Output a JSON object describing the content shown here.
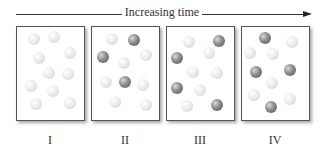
{
  "arrow": {
    "label": "Increasing time"
  },
  "panels": [
    {
      "label": "I",
      "left": 16,
      "spheres": [
        {
          "x": 17,
          "y": 12,
          "t": "light"
        },
        {
          "x": 37,
          "y": 10,
          "t": "light"
        },
        {
          "x": 53,
          "y": 26,
          "t": "light"
        },
        {
          "x": 22,
          "y": 31,
          "t": "light"
        },
        {
          "x": 32,
          "y": 46,
          "t": "light"
        },
        {
          "x": 51,
          "y": 47,
          "t": "light"
        },
        {
          "x": 14,
          "y": 59,
          "t": "light"
        },
        {
          "x": 36,
          "y": 64,
          "t": "light"
        },
        {
          "x": 19,
          "y": 77,
          "t": "light"
        },
        {
          "x": 53,
          "y": 76,
          "t": "light"
        }
      ]
    },
    {
      "label": "II",
      "left": 91,
      "spheres": [
        {
          "x": 20,
          "y": 12,
          "t": "light"
        },
        {
          "x": 42,
          "y": 13,
          "t": "dark"
        },
        {
          "x": 11,
          "y": 30,
          "t": "dark"
        },
        {
          "x": 54,
          "y": 28,
          "t": "light"
        },
        {
          "x": 32,
          "y": 36,
          "t": "light"
        },
        {
          "x": 14,
          "y": 55,
          "t": "light"
        },
        {
          "x": 33,
          "y": 55,
          "t": "dark"
        },
        {
          "x": 51,
          "y": 58,
          "t": "light"
        },
        {
          "x": 23,
          "y": 75,
          "t": "light"
        },
        {
          "x": 54,
          "y": 78,
          "t": "light"
        }
      ]
    },
    {
      "label": "III",
      "left": 166,
      "spheres": [
        {
          "x": 22,
          "y": 15,
          "t": "light"
        },
        {
          "x": 52,
          "y": 14,
          "t": "dark"
        },
        {
          "x": 10,
          "y": 31,
          "t": "dark"
        },
        {
          "x": 42,
          "y": 26,
          "t": "light"
        },
        {
          "x": 26,
          "y": 45,
          "t": "light"
        },
        {
          "x": 50,
          "y": 46,
          "t": "light"
        },
        {
          "x": 10,
          "y": 61,
          "t": "dark"
        },
        {
          "x": 33,
          "y": 63,
          "t": "light"
        },
        {
          "x": 20,
          "y": 79,
          "t": "light"
        },
        {
          "x": 50,
          "y": 78,
          "t": "dark"
        }
      ]
    },
    {
      "label": "IV",
      "left": 241,
      "spheres": [
        {
          "x": 23,
          "y": 11,
          "t": "dark"
        },
        {
          "x": 50,
          "y": 15,
          "t": "light"
        },
        {
          "x": 8,
          "y": 26,
          "t": "light"
        },
        {
          "x": 31,
          "y": 27,
          "t": "light"
        },
        {
          "x": 14,
          "y": 45,
          "t": "dark"
        },
        {
          "x": 48,
          "y": 43,
          "t": "dark"
        },
        {
          "x": 30,
          "y": 56,
          "t": "light"
        },
        {
          "x": 12,
          "y": 68,
          "t": "light"
        },
        {
          "x": 48,
          "y": 72,
          "t": "light"
        },
        {
          "x": 29,
          "y": 80,
          "t": "dark"
        }
      ]
    }
  ]
}
